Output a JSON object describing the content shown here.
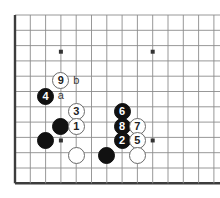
{
  "figure": {
    "type": "go-board-diagram",
    "board": {
      "line_color": "#8c8c8c",
      "edge_color": "#3c3c3c",
      "background_color": "#ffffff",
      "origin_x": 15,
      "origin_y": 15,
      "spacing": 15.3,
      "columns": 13,
      "rows": 12,
      "left_edge_col": 0,
      "bottom_edge_row": 11,
      "star_points": [
        {
          "col": 3,
          "row": 2.4
        },
        {
          "col": 9,
          "row": 2.4
        },
        {
          "col": 3,
          "row": 8.2
        },
        {
          "col": 9,
          "row": 8.2
        }
      ]
    },
    "stones": [
      {
        "label": "9",
        "color": "white",
        "col": 3,
        "row": 4.3
      },
      {
        "label": "4",
        "color": "black",
        "col": 2,
        "row": 5.3
      },
      {
        "label": "3",
        "color": "white",
        "col": 4,
        "row": 6.3
      },
      {
        "label": "6",
        "color": "black",
        "col": 7,
        "row": 6.3
      },
      {
        "label": "",
        "color": "black",
        "col": 3,
        "row": 7.3
      },
      {
        "label": "1",
        "color": "white",
        "col": 4,
        "row": 7.3
      },
      {
        "label": "8",
        "color": "black",
        "col": 7,
        "row": 7.3
      },
      {
        "label": "7",
        "color": "white",
        "col": 8,
        "row": 7.3
      },
      {
        "label": "",
        "color": "black",
        "col": 2,
        "row": 8.2
      },
      {
        "label": "2",
        "color": "black",
        "col": 7,
        "row": 8.2
      },
      {
        "label": "5",
        "color": "white",
        "col": 8,
        "row": 8.2
      },
      {
        "label": "",
        "color": "white",
        "col": 4,
        "row": 9.2
      },
      {
        "label": "",
        "color": "black",
        "col": 6,
        "row": 9.2
      },
      {
        "label": "",
        "color": "white",
        "col": 8,
        "row": 9.2
      }
    ],
    "point_labels": [
      {
        "text": "b",
        "col": 4,
        "row": 4.3
      },
      {
        "text": "a",
        "col": 3,
        "row": 5.3
      }
    ]
  }
}
